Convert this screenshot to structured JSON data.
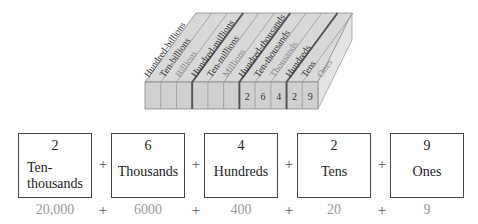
{
  "diagram": {
    "title": "",
    "place_value_columns": [
      {
        "label": "Hundred-billions",
        "digit": ""
      },
      {
        "label": "Ten-billions",
        "digit": ""
      },
      {
        "label": "Billions",
        "digit": ""
      },
      {
        "label": "Hundred-millions",
        "digit": ""
      },
      {
        "label": "Ten-millions",
        "digit": ""
      },
      {
        "label": "Millions",
        "digit": ""
      },
      {
        "label": "Hundred-thousands",
        "digit": ""
      },
      {
        "label": "Ten-thousands",
        "digit": "2"
      },
      {
        "label": "Thousands",
        "digit": "6"
      },
      {
        "label": "Hundreds",
        "digit": "4"
      },
      {
        "label": "Tens",
        "digit": "2"
      },
      {
        "label": "Ones",
        "digit": "9"
      }
    ],
    "front_digits": [
      "",
      "",
      "",
      "",
      "",
      "",
      "2",
      "6",
      "4",
      "2",
      "9"
    ],
    "expanded": [
      {
        "digit": "2",
        "place": "Ten-\nthousands",
        "place_line1": "Ten-",
        "place_line2": "thousands",
        "value": "20,000"
      },
      {
        "digit": "6",
        "place": "Thousands",
        "value": "6000"
      },
      {
        "digit": "4",
        "place": "Hundreds",
        "value": "400"
      },
      {
        "digit": "2",
        "place": "Tens",
        "value": "20"
      },
      {
        "digit": "9",
        "place": "Ones",
        "value": "9"
      }
    ],
    "operator": "+",
    "colors": {
      "block_top": "#d6d6d6",
      "block_front": "#cfcfcf",
      "block_side": "#e2e2e2",
      "divider_thin": "#9a9a9a",
      "divider_thick": "#555555",
      "label_dark": "#333333",
      "label_light": "#8a8a8a",
      "value_text": "#9a9a9a"
    }
  }
}
